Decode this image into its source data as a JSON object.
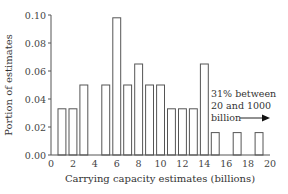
{
  "chart_data": {
    "type": "bar",
    "title": "",
    "xlabel": "Carrying capacity estimates (billions)",
    "ylabel": "Portion of estimates",
    "xlim": [
      0,
      20
    ],
    "ylim": [
      0,
      0.1
    ],
    "x_ticks": [
      "0",
      "2",
      "4",
      "6",
      "8",
      "10",
      "12",
      "14",
      "16",
      "18",
      "20"
    ],
    "y_ticks": [
      "0.00",
      "0.02",
      "0.04",
      "0.06",
      "0.08",
      "0.10"
    ],
    "grid": false,
    "bars": [
      {
        "x": 1,
        "value": 0.033
      },
      {
        "x": 2,
        "value": 0.033
      },
      {
        "x": 3,
        "value": 0.05
      },
      {
        "x": 5,
        "value": 0.05
      },
      {
        "x": 6,
        "value": 0.098
      },
      {
        "x": 7,
        "value": 0.05
      },
      {
        "x": 8,
        "value": 0.065
      },
      {
        "x": 9,
        "value": 0.05
      },
      {
        "x": 10,
        "value": 0.05
      },
      {
        "x": 11,
        "value": 0.033
      },
      {
        "x": 12,
        "value": 0.033
      },
      {
        "x": 13,
        "value": 0.033
      },
      {
        "x": 14,
        "value": 0.065
      },
      {
        "x": 15,
        "value": 0.016
      },
      {
        "x": 17,
        "value": 0.016
      },
      {
        "x": 19,
        "value": 0.016
      }
    ],
    "annotation": {
      "lines": [
        "31% between",
        "20 and 1000",
        "billion"
      ],
      "arrow": "right-arrow"
    }
  }
}
